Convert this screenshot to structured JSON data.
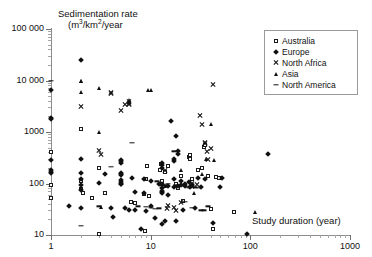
{
  "chart_data": {
    "type": "scatter",
    "title": "",
    "xlabel": "Study duration (year)",
    "ylabel": "Sedimentation rate (m3/km2/year",
    "ylabel_line1": "Sedimentation rate",
    "ylabel_line2_prefix": "(m",
    "ylabel_line2_sup1": "3",
    "ylabel_line2_mid": "/km",
    "ylabel_line2_sup2": "2",
    "ylabel_line2_suffix": "/year",
    "xscale": "log",
    "yscale": "log",
    "xlim": [
      1,
      1000
    ],
    "ylim": [
      10,
      100000
    ],
    "grid": false,
    "xticks": [
      1,
      10,
      100,
      1000
    ],
    "xtick_labels": [
      "1",
      "10",
      "100",
      "1000"
    ],
    "yticks": [
      10,
      100,
      1000,
      10000,
      100000
    ],
    "ytick_labels": [
      "10",
      "100",
      "1000",
      "10 000",
      "100 000"
    ],
    "legend_position": "top-right",
    "series": [
      {
        "name": "Australia",
        "marker": "open-square",
        "points": [
          [
            1,
            400
          ],
          [
            1,
            95
          ],
          [
            1,
            52
          ],
          [
            2,
            1150
          ],
          [
            2,
            112
          ],
          [
            2,
            78
          ],
          [
            2.1,
            64
          ],
          [
            2.6,
            52
          ],
          [
            3,
            200
          ],
          [
            3,
            10.5
          ],
          [
            3.5,
            66
          ],
          [
            6.3,
            44
          ],
          [
            7,
            41
          ],
          [
            8.5,
            62
          ],
          [
            8.8,
            11.7
          ],
          [
            8.9,
            125
          ],
          [
            9.2,
            220
          ],
          [
            9.6,
            57
          ],
          [
            12.5,
            185
          ],
          [
            12.8,
            240
          ],
          [
            13,
            110
          ],
          [
            14,
            165
          ],
          [
            15,
            215
          ],
          [
            18,
            100
          ],
          [
            19,
            80
          ],
          [
            20,
            140
          ],
          [
            21,
            45
          ],
          [
            24,
            330
          ],
          [
            25,
            350
          ],
          [
            25,
            300
          ],
          [
            26,
            125
          ],
          [
            30,
            185
          ],
          [
            33,
            200
          ],
          [
            34,
            510
          ],
          [
            35,
            570
          ],
          [
            38,
            140
          ],
          [
            40,
            32
          ],
          [
            42,
            13
          ],
          [
            45,
            135
          ],
          [
            48,
            130
          ],
          [
            68,
            28
          ]
        ]
      },
      {
        "name": "Europe",
        "marker": "filled-diamond",
        "points": [
          [
            1,
            6600
          ],
          [
            1,
            1850
          ],
          [
            1,
            1800
          ],
          [
            1,
            290
          ],
          [
            1,
            185
          ],
          [
            1,
            170
          ],
          [
            1,
            160
          ],
          [
            1.5,
            37
          ],
          [
            2,
            25000
          ],
          [
            2,
            305
          ],
          [
            2,
            160
          ],
          [
            2,
            120
          ],
          [
            2,
            95
          ],
          [
            2,
            75
          ],
          [
            2,
            33
          ],
          [
            3,
            103
          ],
          [
            3.5,
            155
          ],
          [
            4,
            34
          ],
          [
            4.2,
            22
          ],
          [
            5,
            160
          ],
          [
            5,
            150
          ],
          [
            5,
            145
          ],
          [
            5,
            118
          ],
          [
            5,
            108
          ],
          [
            5,
            100
          ],
          [
            5,
            96
          ],
          [
            5,
            290
          ],
          [
            5,
            270
          ],
          [
            5,
            255
          ],
          [
            5.5,
            33
          ],
          [
            6,
            31
          ],
          [
            6.5,
            128
          ],
          [
            7,
            67
          ],
          [
            7,
            30
          ],
          [
            8,
            13
          ],
          [
            8.5,
            125
          ],
          [
            8.5,
            66
          ],
          [
            9,
            29
          ],
          [
            10,
            112
          ],
          [
            10,
            37
          ],
          [
            11,
            21
          ],
          [
            12,
            96
          ],
          [
            13,
            80
          ],
          [
            13,
            72
          ],
          [
            13,
            68
          ],
          [
            13,
            66
          ],
          [
            13,
            100
          ],
          [
            13,
            200
          ],
          [
            13,
            230
          ],
          [
            13,
            255
          ],
          [
            13,
            16
          ],
          [
            14,
            19
          ],
          [
            15,
            60
          ],
          [
            15,
            90
          ],
          [
            16,
            1650
          ],
          [
            17,
            300
          ],
          [
            17,
            270
          ],
          [
            17,
            120
          ],
          [
            17,
            84
          ],
          [
            18,
            830
          ],
          [
            18,
            19
          ],
          [
            19,
            430
          ],
          [
            19,
            380
          ],
          [
            19,
            90
          ],
          [
            20,
            110
          ],
          [
            20,
            92
          ],
          [
            21,
            30
          ],
          [
            22,
            100
          ],
          [
            22,
            88
          ],
          [
            24,
            105
          ],
          [
            25,
            86
          ],
          [
            26,
            95
          ],
          [
            28,
            33
          ],
          [
            30,
            128
          ],
          [
            32,
            86
          ],
          [
            35,
            120
          ],
          [
            42,
            17
          ],
          [
            50,
            85
          ],
          [
            52,
            130
          ],
          [
            92,
            10.5
          ],
          [
            150,
            380
          ]
        ]
      },
      {
        "name": "North Africa",
        "marker": "cross",
        "points": [
          [
            2,
            3100
          ],
          [
            3,
            440
          ],
          [
            3.2,
            370
          ],
          [
            4,
            5700
          ],
          [
            4,
            5500
          ],
          [
            5,
            2600
          ],
          [
            5.5,
            3400
          ],
          [
            6,
            3900
          ],
          [
            6,
            3600
          ],
          [
            6,
            3400
          ],
          [
            14,
            175
          ],
          [
            15,
            38
          ],
          [
            17,
            34
          ],
          [
            20,
            42
          ],
          [
            26,
            100
          ],
          [
            26,
            92
          ],
          [
            26,
            88
          ],
          [
            31,
            2100
          ],
          [
            33,
            1400
          ],
          [
            35,
            590
          ],
          [
            35,
            620
          ],
          [
            37,
            420
          ],
          [
            38,
            290
          ],
          [
            40,
            480
          ],
          [
            42,
            8200
          ],
          [
            14.5,
            33
          ],
          [
            18,
            30
          ],
          [
            29,
            94
          ]
        ]
      },
      {
        "name": "Asia",
        "marker": "filled-triangle",
        "points": [
          [
            2,
            10000
          ],
          [
            2,
            9600
          ],
          [
            2,
            6100
          ],
          [
            3,
            7200
          ],
          [
            3,
            1000
          ],
          [
            3.2,
            35
          ],
          [
            6,
            4100
          ],
          [
            6,
            3800
          ],
          [
            9.5,
            6500
          ],
          [
            10,
            6400
          ],
          [
            20,
            180
          ],
          [
            25,
            93
          ],
          [
            27,
            65
          ],
          [
            33,
            150
          ],
          [
            36,
            300
          ],
          [
            40,
            1400
          ],
          [
            43,
            290
          ],
          [
            112,
            28
          ],
          [
            14,
            90
          ]
        ]
      },
      {
        "name": "North America",
        "marker": "dash",
        "points": [
          [
            1,
            9900
          ],
          [
            2,
            15
          ],
          [
            3,
            36
          ],
          [
            4,
            210
          ],
          [
            6.5,
            610
          ],
          [
            7.5,
            36
          ],
          [
            9,
            35
          ],
          [
            10,
            34
          ],
          [
            11,
            32
          ],
          [
            11.5,
            110
          ],
          [
            12,
            33
          ],
          [
            13,
            93
          ],
          [
            14,
            93
          ],
          [
            15,
            100
          ],
          [
            17,
            420
          ],
          [
            18,
            95
          ],
          [
            20,
            92
          ],
          [
            22,
            44
          ],
          [
            23,
            86
          ],
          [
            24,
            83
          ],
          [
            26,
            34
          ],
          [
            28,
            84
          ],
          [
            30,
            82
          ],
          [
            32,
            30
          ],
          [
            34,
            30
          ],
          [
            38,
            36
          ]
        ]
      }
    ]
  },
  "legend": {
    "items": [
      {
        "label": "Australia",
        "marker": "open-square"
      },
      {
        "label": "Europe",
        "marker": "filled-diamond"
      },
      {
        "label": "North Africa",
        "marker": "cross"
      },
      {
        "label": "Asia",
        "marker": "filled-triangle"
      },
      {
        "label": "North America",
        "marker": "dash"
      }
    ]
  }
}
